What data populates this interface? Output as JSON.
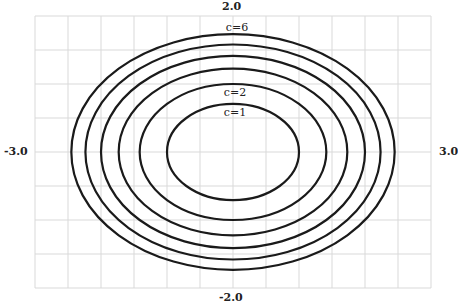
{
  "chart_data": {
    "type": "contour",
    "title": "",
    "equation": "x^2 + 2y^2 = c",
    "xlim": [
      -3.0,
      3.0
    ],
    "ylim": [
      -2.0,
      2.0
    ],
    "grid": true,
    "grid_x_divisions": 12,
    "grid_y_divisions": 8,
    "tick_labels": {
      "top": "2.0",
      "bottom": "-2.0",
      "left": "-3.0",
      "right": "3.0"
    },
    "levels": [
      1,
      2,
      3,
      4,
      5,
      6
    ],
    "curve_labels": [
      {
        "text": "c=1",
        "level": 1
      },
      {
        "text": "c=2",
        "level": 2
      },
      {
        "text": "c=6",
        "level": 6
      }
    ],
    "line_color": "#1a1a1a",
    "grid_color": "#d9d9d9"
  }
}
